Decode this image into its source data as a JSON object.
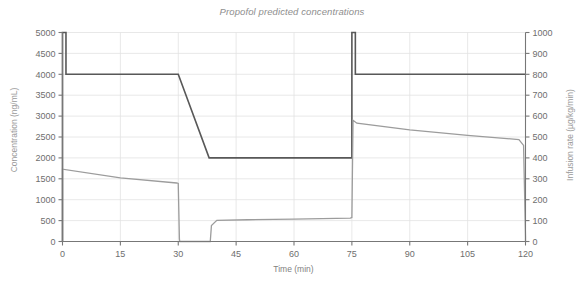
{
  "chart_data": {
    "type": "line",
    "title": "Propofol predicted concentrations",
    "xlabel": "Time (min)",
    "ylabel": "Concentration (ng/mL)",
    "y2label": "Infusion rate (µg/kg/min)",
    "xlim": [
      0,
      120
    ],
    "ylim": [
      0,
      5000
    ],
    "y2lim": [
      0,
      1000
    ],
    "grid": true,
    "legend": "none",
    "xticks": [
      0,
      15,
      30,
      45,
      60,
      75,
      90,
      105,
      120
    ],
    "xtick_labels": [
      "0",
      "15",
      "30",
      "45",
      "60",
      "75",
      "90",
      "105",
      "120"
    ],
    "yticks": [
      0,
      500,
      1000,
      1500,
      2000,
      2500,
      3000,
      3500,
      4000,
      4500,
      5000
    ],
    "ytick_labels": [
      "0",
      "500",
      "1000",
      "1500",
      "2000",
      "2500",
      "3000",
      "3500",
      "4000",
      "4500",
      "5000"
    ],
    "y2ticks": [
      0,
      100,
      200,
      300,
      400,
      500,
      600,
      700,
      800,
      900,
      1000
    ],
    "y2tick_labels": [
      "0",
      "100",
      "200",
      "300",
      "400",
      "500",
      "600",
      "700",
      "800",
      "900",
      "1000"
    ],
    "series": [
      {
        "name": "Infusion rate",
        "axis": "right",
        "color": "#585858",
        "width": 1.6,
        "points": [
          [
            0,
            0
          ],
          [
            0,
            1000
          ],
          [
            0.9,
            1000
          ],
          [
            0.9,
            800
          ],
          [
            30,
            800
          ],
          [
            30,
            800
          ],
          [
            38,
            400
          ],
          [
            75,
            400
          ],
          [
            75,
            1000
          ],
          [
            75.9,
            1000
          ],
          [
            75.9,
            800
          ],
          [
            120,
            800
          ]
        ]
      },
      {
        "name": "Predicted concentration",
        "axis": "left",
        "color": "#9c9c9c",
        "width": 1.3,
        "points": [
          [
            0,
            0
          ],
          [
            0,
            1730
          ],
          [
            15,
            1520
          ],
          [
            29.6,
            1400
          ],
          [
            30,
            1390
          ],
          [
            30.3,
            60
          ],
          [
            30.4,
            0
          ],
          [
            38.3,
            0
          ],
          [
            38.6,
            380
          ],
          [
            40,
            505
          ],
          [
            48,
            520
          ],
          [
            60,
            535
          ],
          [
            74.6,
            560
          ],
          [
            75,
            575
          ],
          [
            75.3,
            2900
          ],
          [
            76.3,
            2830
          ],
          [
            90,
            2670
          ],
          [
            105,
            2540
          ],
          [
            118.3,
            2440
          ],
          [
            119.5,
            2300
          ],
          [
            120,
            120
          ],
          [
            120,
            0
          ]
        ]
      }
    ]
  }
}
